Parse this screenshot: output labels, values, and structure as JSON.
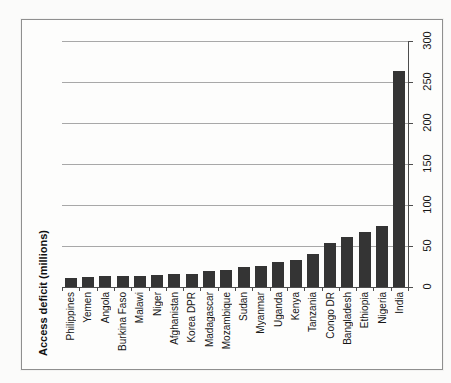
{
  "chart_data": {
    "type": "bar",
    "title": "",
    "ylabel": "Access deficit (millions)",
    "xlabel": "",
    "categories": [
      "Philippines",
      "Yemen",
      "Angola",
      "Burkina Faso",
      "Malawi",
      "Niger",
      "Afghanistan",
      "Korea DPR",
      "Madagascar",
      "Mozambique",
      "Sudan",
      "Myanmar",
      "Uganda",
      "Kenya",
      "Tanzania",
      "Congo DR",
      "Bangladesh",
      "Ethiopia",
      "Nigeria",
      "India"
    ],
    "values": [
      11,
      12,
      13,
      14,
      13,
      15,
      16,
      16,
      20,
      21,
      25,
      26,
      30,
      33,
      40,
      54,
      61,
      67,
      75,
      263
    ],
    "yticks": [
      0,
      50,
      100,
      150,
      200,
      250,
      300
    ],
    "ylim": [
      0,
      300
    ],
    "grid": true,
    "legend": false,
    "orientation": "column chart displayed rotated 90deg counterclockwise (landscape scan); value axis on right, category labels and all text rotated"
  },
  "colors": {
    "bar": "#343434",
    "gridline": "#a8a8a8",
    "axis": "#4d4d4d",
    "frame_border": "#8f8f8f",
    "text": "#161616",
    "background": "#fbfbfa"
  }
}
